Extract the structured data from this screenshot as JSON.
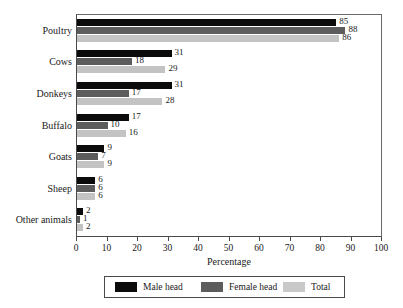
{
  "chart_data": {
    "type": "bar",
    "orientation": "horizontal",
    "title": "",
    "xlabel": "Percentage",
    "ylabel": "",
    "xlim": [
      0,
      100
    ],
    "xticks": [
      0,
      10,
      20,
      30,
      40,
      50,
      60,
      70,
      80,
      90,
      100
    ],
    "grid": false,
    "legend_position": "bottom",
    "categories": [
      "Poultry",
      "Cows",
      "Donkeys",
      "Buffalo",
      "Goats",
      "Sheep",
      "Other animals"
    ],
    "series": [
      {
        "name": "Male head",
        "color": "#0b0b0b",
        "values": [
          85,
          31,
          31,
          17,
          9,
          6,
          2
        ]
      },
      {
        "name": "Female head",
        "color": "#5c5c5c",
        "values": [
          88,
          18,
          17,
          10,
          7,
          6,
          1
        ]
      },
      {
        "name": "Total",
        "color": "#c3c3c3",
        "values": [
          86,
          29,
          28,
          16,
          9,
          6,
          2
        ]
      }
    ],
    "data_labels": [
      [
        "85",
        "88",
        "86"
      ],
      [
        "31",
        "18",
        "29"
      ],
      [
        "31",
        "17",
        "28"
      ],
      [
        "17",
        "10",
        "16"
      ],
      [
        "9",
        "7",
        "9"
      ],
      [
        "6",
        "6",
        "6"
      ],
      [
        "2",
        "1",
        "2"
      ]
    ]
  },
  "legend": {
    "items": [
      {
        "label": "Male head"
      },
      {
        "label": "Female head"
      },
      {
        "label": "Total"
      }
    ]
  }
}
